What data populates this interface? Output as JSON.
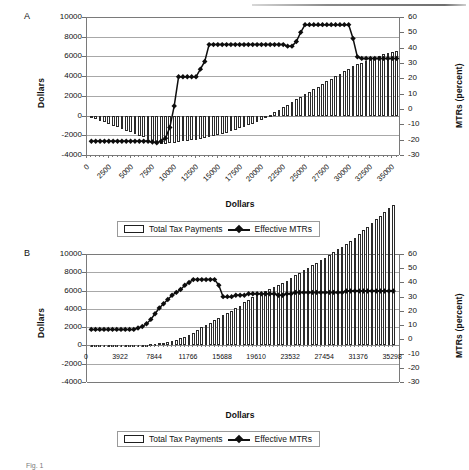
{
  "figure": {
    "caption_fragment": "Fig. 1",
    "legend": {
      "bar_label": "Total Tax Payments",
      "line_label": "Effective MTRs",
      "bar_icon": "open-rectangle-swatch",
      "line_icon": "line-with-diamond-marker-swatch"
    }
  },
  "panels": [
    {
      "id": "A",
      "label": "A",
      "chart_data": {
        "type": "bar",
        "title": "",
        "xlabel": "Dollars",
        "ylabel": "Dollars",
        "y2label": "MTRs (percent)",
        "ylim": [
          -4000,
          10000
        ],
        "y2lim": [
          -30,
          60
        ],
        "yticks": [
          10000,
          8000,
          6000,
          4000,
          2000,
          0,
          -2000,
          -4000
        ],
        "y2ticks": [
          60,
          50,
          40,
          30,
          20,
          10,
          0,
          -10,
          -20,
          -30
        ],
        "xticks": [
          0,
          2500,
          5000,
          7500,
          10000,
          12500,
          15000,
          17500,
          20000,
          22500,
          25000,
          27500,
          30000,
          32500,
          35000
        ],
        "xlim": [
          0,
          36000
        ],
        "grid": true,
        "legend_position": "below",
        "x": [
          500,
          1000,
          1500,
          2000,
          2500,
          3000,
          3500,
          4000,
          4500,
          5000,
          5500,
          6000,
          6500,
          7000,
          7500,
          8000,
          8500,
          9000,
          9500,
          10000,
          10500,
          11000,
          11500,
          12000,
          12500,
          13000,
          13500,
          14000,
          14500,
          15000,
          15500,
          16000,
          16500,
          17000,
          17500,
          18000,
          18500,
          19000,
          19500,
          20000,
          20500,
          21000,
          21500,
          22000,
          22500,
          23000,
          23500,
          24000,
          24500,
          25000,
          25500,
          26000,
          26500,
          27000,
          27500,
          28000,
          28500,
          29000,
          29500,
          30000,
          30500,
          31000,
          31500,
          32000,
          32500,
          33000,
          33500,
          34000,
          34500,
          35000,
          35500
        ],
        "series": [
          {
            "name": "Total Tax Payments",
            "axis": "left",
            "units": "dollars",
            "values": [
              -170,
              -340,
              -510,
              -680,
              -850,
              -1020,
              -1190,
              -1360,
              -1530,
              -1700,
              -1870,
              -2040,
              -2210,
              -2380,
              -2550,
              -2720,
              -2890,
              -2860,
              -2800,
              -2740,
              -2680,
              -2620,
              -2560,
              -2500,
              -2440,
              -2380,
              -2320,
              -2200,
              -2080,
              -1960,
              -1840,
              -1720,
              -1600,
              -1450,
              -1300,
              -1150,
              -1000,
              -820,
              -640,
              -420,
              -180,
              80,
              340,
              600,
              860,
              1120,
              1380,
              1640,
              1900,
              2160,
              2420,
              2680,
              2940,
              3200,
              3460,
              3720,
              3980,
              4240,
              4500,
              4760,
              5020,
              5200,
              5380,
              5560,
              5740,
              5920,
              6080,
              6220,
              6360,
              6480,
              6600
            ]
          },
          {
            "name": "Effective MTRs",
            "axis": "right",
            "units": "percent",
            "values": [
              -21,
              -21,
              -21,
              -21,
              -21,
              -21,
              -21,
              -21,
              -21,
              -21,
              -21,
              -21,
              -21,
              -21,
              -21.5,
              -22,
              -21,
              -19,
              -12,
              2,
              21,
              21,
              21,
              21,
              21,
              26,
              31,
              42,
              42,
              42,
              42,
              42,
              42,
              42,
              42,
              42,
              42,
              42,
              42,
              42,
              42,
              42,
              42,
              42,
              42,
              41,
              41,
              44,
              50,
              55,
              55,
              55,
              55,
              55,
              55,
              55,
              55,
              55,
              55,
              55,
              46,
              34,
              33,
              33,
              33,
              33,
              33,
              33,
              33,
              33,
              33
            ]
          }
        ]
      }
    },
    {
      "id": "B",
      "label": "B",
      "chart_data": {
        "type": "bar",
        "title": "",
        "xlabel": "Dollars",
        "ylabel": "Dollars",
        "y2label": "MTRs (percent)",
        "ylim": [
          -4000,
          10000
        ],
        "y2lim": [
          -30,
          60
        ],
        "yticks": [
          10000,
          8000,
          6000,
          4000,
          2000,
          0,
          -2000,
          -4000
        ],
        "y2ticks": [
          60,
          50,
          40,
          30,
          20,
          10,
          0,
          -10,
          -20,
          -30
        ],
        "xticks": [
          0,
          3922,
          7844,
          11766,
          15688,
          19610,
          23532,
          27454,
          31376,
          35298
        ],
        "xlim": [
          0,
          36200
        ],
        "grid": true,
        "legend_position": "below",
        "x": [
          490,
          980,
          1470,
          1961,
          2451,
          2941,
          3431,
          3922,
          4412,
          4902,
          5392,
          5883,
          6373,
          6863,
          7353,
          7844,
          8334,
          8824,
          9314,
          9805,
          10295,
          10785,
          11275,
          11766,
          12256,
          12746,
          13236,
          13727,
          14217,
          14707,
          15197,
          15688,
          16178,
          16668,
          17158,
          17649,
          18139,
          18629,
          19119,
          19610,
          20100,
          20590,
          21080,
          21571,
          22061,
          22551,
          23041,
          23532,
          24022,
          24512,
          25002,
          25493,
          25983,
          26473,
          26963,
          27454,
          27944,
          28434,
          28924,
          29415,
          29905,
          30395,
          30885,
          31376,
          31866,
          32356,
          32846,
          33337,
          33827,
          34317,
          34807,
          35298
        ],
        "series": [
          {
            "name": "Total Tax Payments",
            "axis": "left",
            "units": "dollars",
            "values": [
              -30,
              -40,
              -50,
              -60,
              -60,
              -60,
              -50,
              -40,
              -20,
              0,
              20,
              40,
              70,
              100,
              140,
              190,
              250,
              320,
              400,
              500,
              620,
              760,
              920,
              1100,
              1350,
              1650,
              2000,
              2200,
              2450,
              2750,
              3050,
              3300,
              3550,
              3800,
              4050,
              4350,
              4700,
              5000,
              5250,
              5500,
              5750,
              5950,
              6150,
              6350,
              6600,
              6850,
              7100,
              7400,
              7700,
              7950,
              8200,
              8500,
              8800,
              9050,
              9300,
              9600,
              9900,
              10200,
              10500,
              10800,
              11100,
              11400,
              11800,
              12200,
              12600,
              13000,
              13400,
              13800,
              14200,
              14600,
              15000,
              15400
            ]
          },
          {
            "name": "Effective MTRs",
            "axis": "right",
            "units": "percent",
            "values": [
              7,
              7,
              7,
              7,
              7,
              7,
              7,
              7,
              7,
              7,
              7,
              8,
              9,
              11,
              14,
              18,
              22,
              25,
              28,
              31,
              33,
              35,
              38,
              40,
              42,
              42,
              42,
              42,
              42,
              42,
              38,
              30,
              30,
              30,
              31,
              31,
              31,
              32,
              32,
              32,
              32,
              32,
              32,
              32,
              31,
              31,
              32,
              32,
              33,
              33,
              33,
              33,
              33,
              33,
              33,
              33,
              33,
              33,
              33,
              33,
              34,
              34,
              34,
              34,
              34,
              34,
              34,
              34,
              34,
              34,
              34,
              34
            ]
          }
        ]
      }
    }
  ]
}
